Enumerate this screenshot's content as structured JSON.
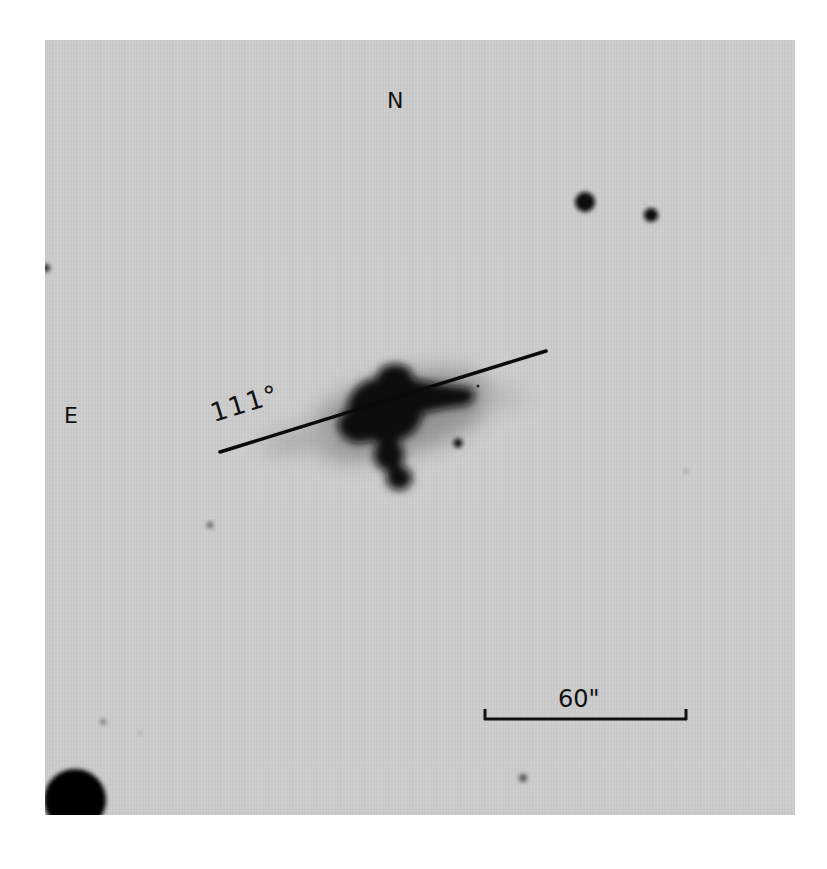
{
  "figure": {
    "type": "astronomical-photographic-plate",
    "background_color": "#cdcdcd",
    "page_color": "#ffffff",
    "ink_color": "#111111"
  },
  "orientation": {
    "north_label": "N",
    "east_label": "E"
  },
  "position_angle": {
    "label": "111°",
    "value_deg": 111,
    "line": {
      "x1": 220,
      "y1": 452,
      "x2": 546,
      "y2": 351
    }
  },
  "scale_bar": {
    "label": "60\"",
    "value_arcsec": 60,
    "x1": 484,
    "x2": 687,
    "y": 719
  },
  "objects": {
    "galaxy": {
      "cx": 400,
      "cy": 415,
      "description": "bright galaxy with extended arm to the west and knot to the south"
    },
    "stars": [
      {
        "cx": 585,
        "cy": 202,
        "r": 10
      },
      {
        "cx": 651,
        "cy": 215,
        "r": 7
      },
      {
        "cx": 458,
        "cy": 443,
        "r": 5
      },
      {
        "cx": 75,
        "cy": 800,
        "r": 31
      },
      {
        "cx": 210,
        "cy": 525,
        "r": 3
      },
      {
        "cx": 103,
        "cy": 722,
        "r": 3
      },
      {
        "cx": 523,
        "cy": 778,
        "r": 4
      },
      {
        "cx": 686,
        "cy": 471,
        "r": 2
      },
      {
        "cx": 46,
        "cy": 268,
        "r": 4
      }
    ]
  }
}
